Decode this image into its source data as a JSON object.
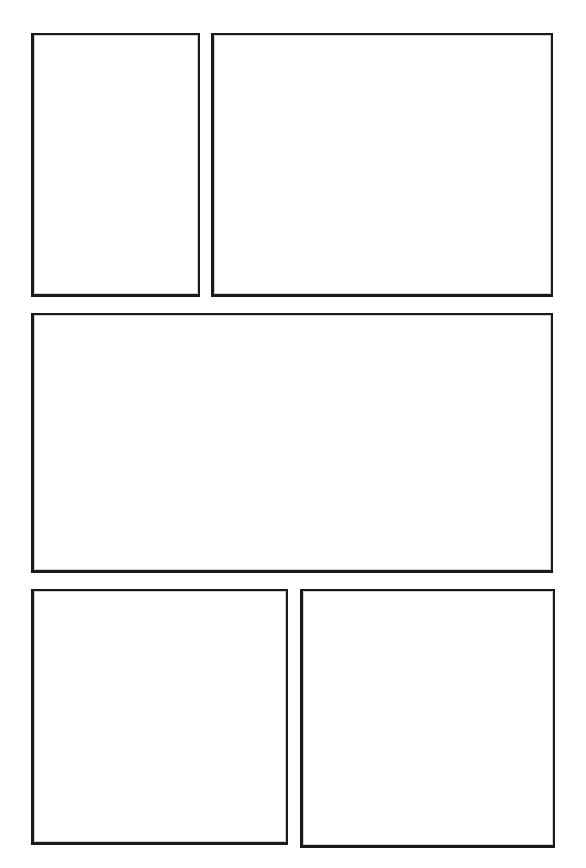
{
  "document": {
    "type": "comic-page-template",
    "title": "Blank Comic Page Template",
    "page_width": 586,
    "page_height": 868,
    "background_color": "#ffffff",
    "ink_color": "#1a1a1a",
    "panel_count": 5,
    "layout_description": "Three tiers: two panels on top, one full-width panel in the middle, two panels on the bottom.",
    "panel_content": ""
  },
  "panels": [
    {
      "id": "panel-1",
      "label": "",
      "tier": "top",
      "position": "left",
      "x": 31,
      "y": 33,
      "width": 169,
      "height": 264,
      "content": ""
    },
    {
      "id": "panel-2",
      "label": "",
      "tier": "top",
      "position": "right",
      "x": 211,
      "y": 33,
      "width": 342,
      "height": 264,
      "content": ""
    },
    {
      "id": "panel-3",
      "label": "",
      "tier": "middle",
      "position": "full-width",
      "x": 31,
      "y": 313,
      "width": 522,
      "height": 260,
      "content": ""
    },
    {
      "id": "panel-4",
      "label": "",
      "tier": "bottom",
      "position": "left",
      "x": 31,
      "y": 589,
      "width": 257,
      "height": 256,
      "content": ""
    },
    {
      "id": "panel-5",
      "label": "",
      "tier": "bottom",
      "position": "right",
      "x": 300,
      "y": 589,
      "width": 255,
      "height": 259,
      "content": ""
    }
  ]
}
